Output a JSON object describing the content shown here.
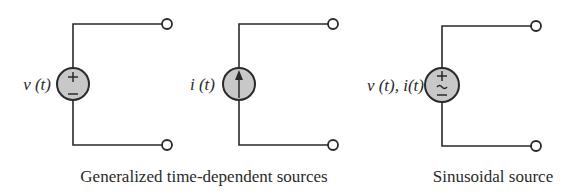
{
  "colors": {
    "ink": "#2a2a2a",
    "source_fill": "#c8c8c8",
    "background": "#ffffff"
  },
  "circuits": [
    {
      "id": "voltage-source",
      "label": "v (t)",
      "symbol": "plus-minus",
      "center": [
        73,
        84
      ],
      "radius": 16,
      "terminals": [
        [
          167,
          24
        ],
        [
          167,
          145
        ]
      ]
    },
    {
      "id": "current-source",
      "label": "i (t)",
      "symbol": "up-arrow",
      "center": [
        239,
        84
      ],
      "radius": 16,
      "terminals": [
        [
          333,
          24
        ],
        [
          333,
          145
        ]
      ]
    },
    {
      "id": "sinusoidal-source",
      "label": "v (t), i(t)",
      "symbol": "plus-tilde-minus",
      "center": [
        442,
        85
      ],
      "radius": 17,
      "terminals": [
        [
          536,
          26
        ],
        [
          536,
          146
        ]
      ]
    }
  ],
  "captions": {
    "generalized": "Generalized time-dependent sources",
    "sinusoidal": "Sinusoidal source"
  }
}
